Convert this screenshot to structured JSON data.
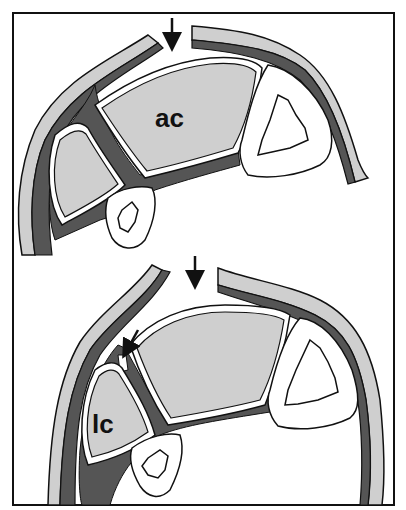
{
  "figure": {
    "panels": [
      {
        "id": "top",
        "label": "ac",
        "arrows": [
          {
            "direction": "down",
            "position": "gap-top"
          }
        ]
      },
      {
        "id": "bottom",
        "label": "lc",
        "arrows": [
          {
            "direction": "down",
            "position": "gap-top"
          },
          {
            "direction": "down-left",
            "position": "septum-defect"
          }
        ]
      }
    ],
    "colors": {
      "outline": "#111111",
      "light_fill": "#cfcfcf",
      "dark_fill": "#555555",
      "background": "#ffffff"
    }
  }
}
